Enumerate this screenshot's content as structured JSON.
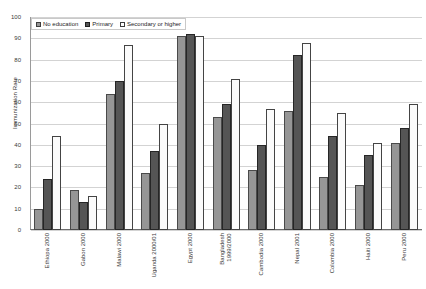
{
  "chart_data": {
    "type": "bar",
    "title": "",
    "xlabel": "",
    "ylabel": "Immunization Rate",
    "ylim": [
      0,
      100
    ],
    "ytick_step": 10,
    "yticks": [
      100,
      90,
      80,
      70,
      60,
      50,
      40,
      30,
      20,
      10,
      0
    ],
    "grid": true,
    "legend_position": "top-left",
    "categories": [
      "Ethiopa 2000",
      "Gabon 2000",
      "Malawi 2000",
      "Uganda 2000/01",
      "Egypt 2000",
      "Bangladesh\n1999/2000",
      "Cambodia 2000",
      "Nepal 2001",
      "Colombia 2000",
      "Haiti 2000",
      "Peru 2000"
    ],
    "series": [
      {
        "name": "No education",
        "color": "#969696",
        "values": [
          10,
          19,
          64,
          27,
          91,
          53,
          28,
          56,
          25,
          21,
          41
        ]
      },
      {
        "name": "Primary",
        "color": "#555555",
        "values": [
          24,
          13,
          70,
          37,
          92,
          59,
          40,
          82,
          44,
          35,
          48
        ]
      },
      {
        "name": "Secondary or higher",
        "color": "#ffffff",
        "values": [
          44,
          16,
          87,
          50,
          91,
          71,
          57,
          88,
          55,
          41,
          59
        ]
      }
    ]
  }
}
